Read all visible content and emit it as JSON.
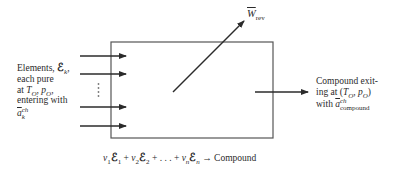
{
  "diagram": {
    "type": "control-volume schematic",
    "inlet_label": {
      "line1": "Elements,",
      "symbol": "ℰ",
      "symbol_sub": "k",
      "line2": "each pure",
      "line3_prefix": "at ",
      "T": "T",
      "T_sub": "O",
      "p": "p",
      "p_sub": "O",
      "line4": "entering with",
      "a": "a",
      "a_sup": "ch",
      "a_sub": "k"
    },
    "work_label": {
      "symbol": "W",
      "sub": "rev"
    },
    "outlet_label": {
      "line1": "Compound exit-",
      "line2_prefix": "ing at (",
      "T": "T",
      "T_sub": "O",
      "p": "p",
      "p_sub": "O",
      "line2_suffix": ")",
      "line3_prefix": "with ",
      "a": "a",
      "a_sup": "ch",
      "a_sub": "compound"
    },
    "equation": {
      "nu": "ν",
      "E": "ℰ",
      "term1_sub": "1",
      "term2_sub": "2",
      "termn_sub": "n",
      "plus": "+",
      "ellipsis": ". . .",
      "arrow": "→",
      "product": "Compound"
    },
    "inlet_arrows": 4,
    "ellipsis_dots": "⋮",
    "colors": {
      "line": "#2b2b2b",
      "box": "#555555",
      "text": "#2a2a2a"
    }
  }
}
